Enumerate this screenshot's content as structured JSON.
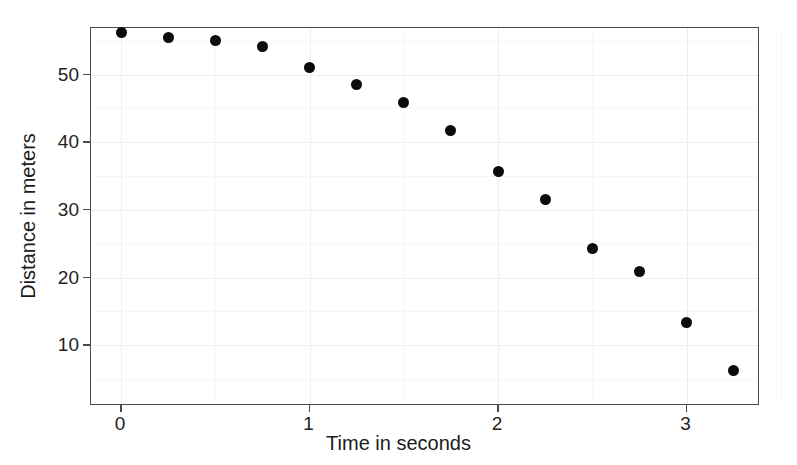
{
  "chart_data": {
    "type": "scatter",
    "title": "",
    "xlabel": "Time in seconds",
    "ylabel": "Distance in meters",
    "xlim": [
      -0.16,
      3.39
    ],
    "ylim": [
      1.0,
      56.9
    ],
    "xticks": [
      "0",
      "1",
      "2",
      "3"
    ],
    "xtick_values": [
      0,
      1,
      2,
      3
    ],
    "yticks": [
      "10",
      "20",
      "30",
      "40",
      "50"
    ],
    "ytick_values": [
      10,
      20,
      30,
      40,
      50
    ],
    "grid": true,
    "legend": "none",
    "marker": "filled-circle",
    "marker_color": "#0b0b0b",
    "x": [
      0.0,
      0.25,
      0.5,
      0.75,
      1.0,
      1.25,
      1.5,
      1.75,
      2.0,
      2.25,
      2.5,
      2.75,
      3.0,
      3.25
    ],
    "y": [
      56.3,
      55.5,
      55.0,
      54.1,
      51.0,
      48.5,
      45.9,
      41.8,
      35.7,
      31.5,
      24.3,
      20.9,
      13.3,
      6.2
    ],
    "points": [
      {
        "x": 0.0,
        "y": 56.3
      },
      {
        "x": 0.25,
        "y": 55.5
      },
      {
        "x": 0.5,
        "y": 55.0
      },
      {
        "x": 0.75,
        "y": 54.1
      },
      {
        "x": 1.0,
        "y": 51.0
      },
      {
        "x": 1.25,
        "y": 48.5
      },
      {
        "x": 1.5,
        "y": 45.9
      },
      {
        "x": 1.75,
        "y": 41.8
      },
      {
        "x": 2.0,
        "y": 35.7
      },
      {
        "x": 2.25,
        "y": 31.5
      },
      {
        "x": 2.5,
        "y": 24.3
      },
      {
        "x": 2.75,
        "y": 20.9
      },
      {
        "x": 3.0,
        "y": 13.3
      },
      {
        "x": 3.25,
        "y": 6.2
      }
    ]
  },
  "axes": {
    "frame_color": "#4a4a4a",
    "gridline_major_color": "#eeeeee",
    "gridline_minor_color": "#f7f7f7",
    "background": "#ffffff"
  }
}
